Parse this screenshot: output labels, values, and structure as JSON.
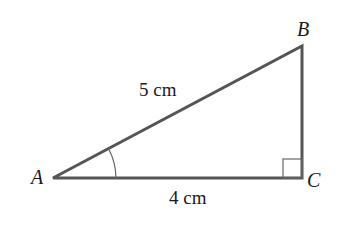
{
  "diagram": {
    "type": "right-triangle",
    "vertices": {
      "A": {
        "label": "A",
        "x": 53,
        "y": 178
      },
      "B": {
        "label": "B",
        "x": 302,
        "y": 46
      },
      "C": {
        "label": "C",
        "x": 302,
        "y": 178
      }
    },
    "sides": {
      "hypotenuse_AB": {
        "label": "5 cm"
      },
      "base_AC": {
        "label": "4 cm"
      }
    },
    "right_angle_at": "C",
    "marked_angle_at": "A",
    "line_color": "#555555"
  }
}
